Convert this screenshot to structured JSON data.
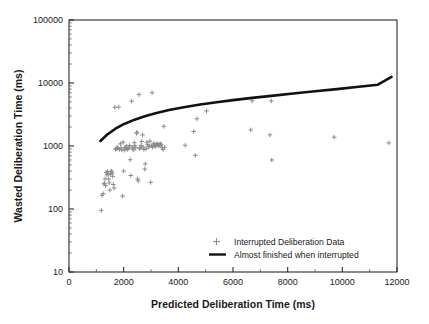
{
  "chart_data": {
    "type": "scatter",
    "title": "",
    "xlabel": "Predicted Deliberation Time (ms)",
    "ylabel": "Wasted Deliberation Time (ms)",
    "xlim": [
      0,
      12000
    ],
    "ylim": [
      10,
      100000
    ],
    "xscale": "linear",
    "yscale": "log",
    "grid": false,
    "xticks": [
      0,
      2000,
      4000,
      6000,
      8000,
      10000,
      12000
    ],
    "xticklabels": [
      "0",
      "2000",
      "4000",
      "6000",
      "8000",
      "10000",
      "12000"
    ],
    "xminor_tick_step": 1000,
    "yticks": [
      10,
      100,
      1000,
      10000,
      100000
    ],
    "yticklabels": [
      "10",
      "100",
      "1000",
      "10000",
      "100000"
    ],
    "yminor_ticks": "log-decade-2-to-9",
    "legend_position": "lower-center-right",
    "legend": [
      {
        "label": "Interrupted Deliberation Data",
        "marker": "plus",
        "color": "#8c8c8c"
      },
      {
        "label": "Almost finished when interrupted",
        "marker": "line",
        "color": "#111111"
      }
    ],
    "series": [
      {
        "name": "Interrupted Deliberation Data",
        "type": "scatter",
        "marker": "plus",
        "color": "#8c8c8c",
        "points": [
          [
            1180,
            95
          ],
          [
            1210,
            165
          ],
          [
            1250,
            175
          ],
          [
            1280,
            250
          ],
          [
            1300,
            255
          ],
          [
            1320,
            300
          ],
          [
            1340,
            235
          ],
          [
            1360,
            380
          ],
          [
            1390,
            350
          ],
          [
            1410,
            395
          ],
          [
            1430,
            360
          ],
          [
            1450,
            300
          ],
          [
            1470,
            260
          ],
          [
            1490,
            200
          ],
          [
            1510,
            355
          ],
          [
            1540,
            390
          ],
          [
            1560,
            400
          ],
          [
            1580,
            370
          ],
          [
            1600,
            330
          ],
          [
            1620,
            245
          ],
          [
            1650,
            215
          ],
          [
            1680,
            4100
          ],
          [
            1700,
            890
          ],
          [
            1730,
            905
          ],
          [
            1760,
            950
          ],
          [
            1790,
            920
          ],
          [
            1820,
            4150
          ],
          [
            1850,
            880
          ],
          [
            1880,
            1080
          ],
          [
            1900,
            930
          ],
          [
            1930,
            870
          ],
          [
            1960,
            160
          ],
          [
            1980,
            1150
          ],
          [
            2000,
            400
          ],
          [
            2020,
            860
          ],
          [
            2050,
            950
          ],
          [
            2080,
            920
          ],
          [
            2100,
            1000
          ],
          [
            2130,
            880
          ],
          [
            2160,
            900
          ],
          [
            2190,
            930
          ],
          [
            2210,
            1020
          ],
          [
            2240,
            605
          ],
          [
            2260,
            340
          ],
          [
            2290,
            5150
          ],
          [
            2310,
            960
          ],
          [
            2340,
            900
          ],
          [
            2370,
            870
          ],
          [
            2390,
            1130
          ],
          [
            2410,
            1010
          ],
          [
            2440,
            950
          ],
          [
            2470,
            1600
          ],
          [
            2490,
            1650
          ],
          [
            2510,
            300
          ],
          [
            2530,
            280
          ],
          [
            2560,
            6550
          ],
          [
            2580,
            910
          ],
          [
            2610,
            940
          ],
          [
            2640,
            1020
          ],
          [
            2660,
            1180
          ],
          [
            2690,
            1500
          ],
          [
            2710,
            960
          ],
          [
            2740,
            880
          ],
          [
            2770,
            430
          ],
          [
            2790,
            520
          ],
          [
            2820,
            900
          ],
          [
            2850,
            1150
          ],
          [
            2880,
            1050
          ],
          [
            2900,
            970
          ],
          [
            2930,
            990
          ],
          [
            2960,
            1190
          ],
          [
            2990,
            265
          ],
          [
            3010,
            1010
          ],
          [
            3040,
            7000
          ],
          [
            3060,
            960
          ],
          [
            3090,
            1040
          ],
          [
            3110,
            1100
          ],
          [
            3140,
            1020
          ],
          [
            3170,
            980
          ],
          [
            3200,
            1060
          ],
          [
            3230,
            1090
          ],
          [
            3260,
            1030
          ],
          [
            3290,
            1000
          ],
          [
            3320,
            1070
          ],
          [
            3350,
            1080
          ],
          [
            3380,
            1040
          ],
          [
            3410,
            940
          ],
          [
            3440,
            880
          ],
          [
            3470,
            2050
          ],
          [
            3500,
            950
          ],
          [
            4250,
            1030
          ],
          [
            4560,
            1700
          ],
          [
            4620,
            710
          ],
          [
            4680,
            2700
          ],
          [
            5030,
            3600
          ],
          [
            6650,
            1800
          ],
          [
            6700,
            5200
          ],
          [
            7350,
            1500
          ],
          [
            7400,
            5200
          ],
          [
            7420,
            600
          ],
          [
            9700,
            1380
          ],
          [
            11700,
            1120
          ]
        ]
      },
      {
        "name": "Almost finished when interrupted",
        "type": "line",
        "color": "#111111",
        "linewidth": 2.6,
        "points": [
          [
            1150,
            1200
          ],
          [
            1400,
            1520
          ],
          [
            1700,
            1880
          ],
          [
            2000,
            2220
          ],
          [
            2400,
            2620
          ],
          [
            2800,
            3000
          ],
          [
            3200,
            3350
          ],
          [
            3700,
            3750
          ],
          [
            4200,
            4120
          ],
          [
            4800,
            4550
          ],
          [
            5400,
            4950
          ],
          [
            6000,
            5350
          ],
          [
            6700,
            5800
          ],
          [
            7400,
            6250
          ],
          [
            8200,
            6800
          ],
          [
            9000,
            7400
          ],
          [
            9800,
            8000
          ],
          [
            10600,
            8700
          ],
          [
            11300,
            9400
          ],
          [
            11800,
            12500
          ]
        ]
      }
    ]
  },
  "axes": {
    "x_title": "Predicted Deliberation Time (ms)",
    "y_title": "Wasted Deliberation Time (ms)"
  }
}
